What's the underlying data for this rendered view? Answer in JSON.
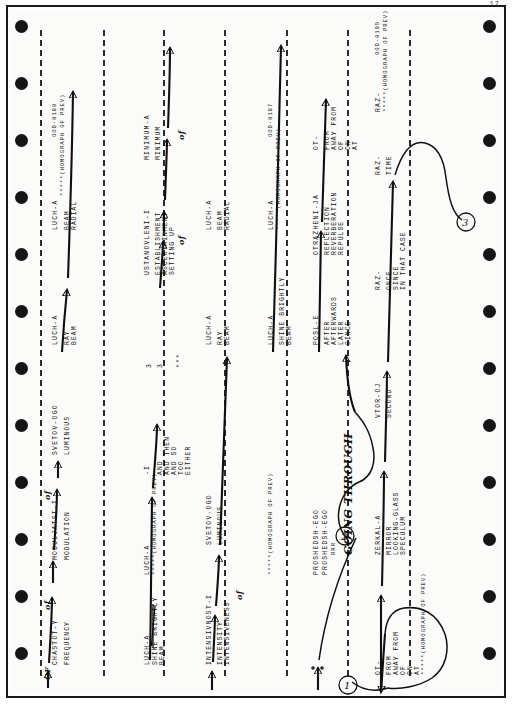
{
  "page": {
    "number": "17",
    "media": "continuous tractor-feed computer printout, scanned sideways",
    "sprocket_hole_count": 12
  },
  "legend": {
    "homograph_marker": "*****(HOMOGRAPH OF PREV)",
    "stem_suffix_dash": "-"
  },
  "entries": [
    {
      "id": "chastot",
      "stem": "CHASTOT-Y",
      "glosses": [
        "FREQUENCY"
      ],
      "connector_words": [
        "OF",
        "of",
        "of"
      ],
      "code": "",
      "homograph": false
    },
    {
      "id": "moduljatsi",
      "stem": "MODULJATSI-I",
      "glosses": [
        "MODULATION"
      ],
      "connector_words": [
        "of"
      ],
      "code": "",
      "homograph": false
    },
    {
      "id": "svetov-1",
      "stem": "SVETOV-OGO",
      "glosses": [
        "LUMINOUS"
      ],
      "connector_words": [],
      "code": "",
      "homograph": false
    },
    {
      "id": "luch-1",
      "stem": "LUCH-A",
      "glosses": [
        "RAY",
        "BEAM"
      ],
      "connector_words": [],
      "code": "",
      "homograph": false
    },
    {
      "id": "luch-1-homo",
      "stem": "LUCH-A",
      "glosses": [
        "BEAM",
        "RADIAL"
      ],
      "code": "OOD-0180",
      "homograph": true,
      "homograph_note": "*****(HOMOGRAPH OF PREV)"
    },
    {
      "id": "luch-struck",
      "stem": "LUCH-A",
      "glosses": [
        "BEAM"
      ],
      "struck_gloss": "SHINE BRIGHTLY",
      "struck": true,
      "code": "",
      "homograph": false
    },
    {
      "id": "luch-struck-homo",
      "stem": "LUCH-A",
      "homograph_note": "*****(HOMOGRAPH OF PREV)",
      "glosses": [],
      "code": "",
      "homograph": true
    },
    {
      "id": "conj-list",
      "stem": "-I",
      "glosses": [
        "AND",
        "AND THEN",
        "AND SO",
        "TOO",
        "EITHER"
      ],
      "code": "",
      "homograph": false,
      "footnote_markers": [
        "3",
        "3",
        "***"
      ]
    },
    {
      "id": "ustanovleni",
      "stem": "USTANOVLENI-I",
      "glosses": [
        "ESTABLISHMENT",
        "ASCERTAINMENT",
        "SETTING UP"
      ],
      "code": "",
      "homograph": false
    },
    {
      "id": "minimum",
      "stem": "MINIMUM-A",
      "glosses": [
        "MINIMUM"
      ],
      "connector_words": [
        "of",
        "of"
      ],
      "code": "",
      "homograph": false
    },
    {
      "id": "intensivnost",
      "stem": "INTENSIVNOST-I",
      "glosses": [
        "INTENSITY",
        "INTENSIVENESS"
      ],
      "connector_words": [
        "of"
      ],
      "code": "",
      "homograph": false
    },
    {
      "id": "svetov-2",
      "stem": "SVETOV-OGO",
      "glosses": [
        "LUMINOUS"
      ],
      "code": "",
      "homograph": false
    },
    {
      "id": "luch-2",
      "stem": "LUCH-A",
      "glosses": [
        "RAY",
        "BEAM"
      ],
      "code": "",
      "homograph": false
    },
    {
      "id": "luch-2b",
      "stem": "LUCH-A",
      "glosses": [
        "BEAM",
        "RADIAL"
      ],
      "code": "",
      "homograph": false
    },
    {
      "id": "luch-3",
      "stem": "LUCH-A",
      "glosses": [
        "SHINE BRIGHTLY",
        "BEAM"
      ],
      "code": "",
      "homograph": false
    },
    {
      "id": "luch-3-homo",
      "stem": "LUCH-A",
      "glosses": [],
      "homograph_note": "*****(HOMOGRAPH OF PREV)",
      "code": "OOD-0187",
      "homograph": true
    },
    {
      "id": "proshedsh-1",
      "stem": "PROSHEDSH-EGO",
      "glosses": [],
      "code": "",
      "homograph": false
    },
    {
      "id": "proshedsh-2",
      "stem": "PROSHEDSH-EGO",
      "glosses": [],
      "handwritten_gloss": "GOING THROUGH",
      "handwritten_marker": "RRR",
      "code": "",
      "homograph": false
    },
    {
      "id": "posl",
      "stem": "POSL-E",
      "glosses": [
        "AFTER",
        "AFTERWARDS",
        "LATER",
        "SINCE"
      ],
      "code": "",
      "homograph": false
    },
    {
      "id": "otrazheni",
      "stem": "OTRAZHENI-JA",
      "glosses": [
        "REFLECTION",
        "REVERBERATION",
        "REPULSE"
      ],
      "code": "",
      "homograph": false
    },
    {
      "id": "ot-top",
      "stem": "OT-",
      "glosses": [
        "FROM",
        "AWAY FROM",
        "OF",
        "ON",
        "AT"
      ],
      "code": "",
      "homograph": false
    },
    {
      "id": "ot-bottom",
      "stem": "OT-",
      "glosses": [
        "FROM",
        "AWAY FROM",
        "OF",
        "ON",
        "AT"
      ],
      "homograph_note": "*****(HOMOGRAPH OF PREV)",
      "code": "",
      "homograph": true
    },
    {
      "id": "zerkal",
      "stem": "ZERKAL-A",
      "glosses": [
        "MIRROR",
        "LOOKING-GLASS",
        "SPECULUM"
      ],
      "code": "",
      "homograph": false
    },
    {
      "id": "vtor",
      "stem": "VTOR-OJ",
      "glosses": [
        "SECOND"
      ],
      "code": "",
      "homograph": false
    },
    {
      "id": "raz-1",
      "stem": "RAZ-",
      "glosses": [
        "ONCE",
        "SINCE",
        "IN THAT CASE"
      ],
      "code": "",
      "homograph": false
    },
    {
      "id": "raz-2",
      "stem": "RAZ-",
      "glosses": [
        "TIME"
      ],
      "code": "",
      "homograph": false
    },
    {
      "id": "raz-3",
      "stem": "RAZ-",
      "glosses": [],
      "homograph_note": "*****(HOMOGRAPH OF PREV)",
      "code": "OOD-0195",
      "homograph": true
    }
  ],
  "loop_labels": [
    "1",
    "2",
    "3"
  ],
  "footnote_symbols": [
    "3",
    "3",
    "***"
  ]
}
